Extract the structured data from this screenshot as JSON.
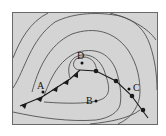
{
  "diagram": {
    "type": "weather-map",
    "colors": {
      "background": "#d4d4d4",
      "isobar": "#505050",
      "front": "#1a1a1a",
      "border": "#6a6a6a"
    },
    "points": [
      {
        "id": "A",
        "label": "A"
      },
      {
        "id": "B",
        "label": "B"
      },
      {
        "id": "C",
        "label": "C"
      },
      {
        "id": "D",
        "label": "D"
      }
    ],
    "fronts": [
      {
        "type": "cold-front",
        "symbol": "triangles"
      },
      {
        "type": "warm-front",
        "symbol": "semicircles"
      }
    ]
  }
}
